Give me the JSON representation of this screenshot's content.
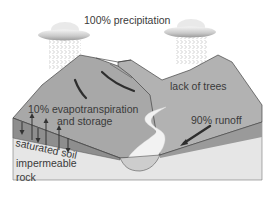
{
  "diagram": {
    "labels": {
      "precipitation": "100% precipitation",
      "lack_of_trees": "lack of trees",
      "evapotranspiration_line1": "10% evapotranspiration",
      "evapotranspiration_line2": "and storage",
      "runoff": "90% runoff",
      "saturated_soil": "saturated soil",
      "impermeable_line1": "impermeable",
      "impermeable_line2": "rock"
    },
    "elements": {
      "clouds": 2,
      "rain_areas": 2,
      "downslope_arrows": 2,
      "runoff_arrow": 1,
      "evaporation_up_arrows": 3,
      "infiltration_down_arrows": 3
    },
    "colors": {
      "mountain": "#a9a9a9",
      "mountain_far": "#b8b8b8",
      "soil": "#8c8c8c",
      "rock": "#e6e6e6",
      "river": "#f2f2f2",
      "lake": "#cfcfcf",
      "text": "#3a3a3a",
      "arrow": "#333333"
    }
  }
}
